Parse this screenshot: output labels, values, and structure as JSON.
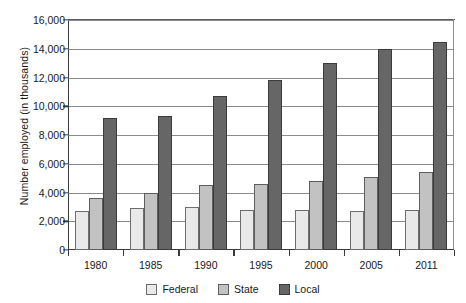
{
  "chart_data": {
    "type": "bar",
    "title": "",
    "xlabel": "",
    "ylabel": "Number employed (in thousands)",
    "categories": [
      "1980",
      "1985",
      "1990",
      "1995",
      "2000",
      "2005",
      "2011"
    ],
    "series": [
      {
        "name": "Federal",
        "color": "#e9e9e9",
        "values": [
          2700,
          2900,
          3000,
          2800,
          2800,
          2700,
          2800
        ]
      },
      {
        "name": "State",
        "color": "#c2c2c2",
        "values": [
          3600,
          3950,
          4500,
          4600,
          4800,
          5100,
          5400
        ]
      },
      {
        "name": "Local",
        "color": "#666666",
        "values": [
          9200,
          9350,
          10700,
          11800,
          13000,
          14000,
          14500
        ]
      }
    ],
    "ylim": [
      0,
      16000
    ],
    "ytick_step": 2000,
    "ytick_labels": [
      "0",
      "2,000",
      "4,000",
      "6,000",
      "8,000",
      "10,000",
      "12,000",
      "14,000",
      "16,000"
    ],
    "grid": true,
    "legend_position": "bottom"
  },
  "legend": {
    "items": [
      {
        "label": "Federal"
      },
      {
        "label": "State"
      },
      {
        "label": "Local"
      }
    ]
  }
}
